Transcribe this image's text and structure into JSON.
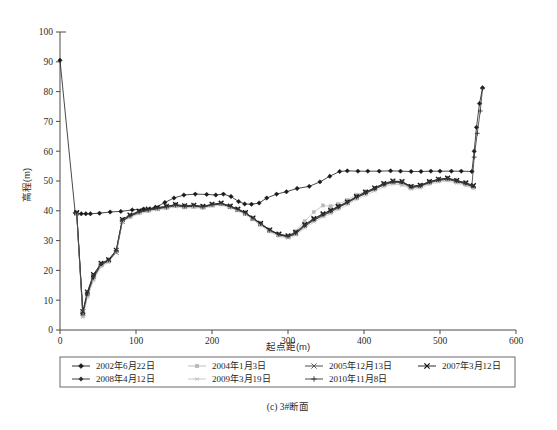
{
  "chart_data": {
    "type": "line",
    "title": "",
    "caption": "(c) 3#断面",
    "xlabel": "起点距(m)",
    "ylabel": "高程(m)",
    "xlim": [
      0,
      600
    ],
    "ylim": [
      0,
      100
    ],
    "xticks": [
      0,
      100,
      200,
      300,
      400,
      500,
      600
    ],
    "yticks": [
      0,
      10,
      20,
      30,
      40,
      50,
      60,
      70,
      80,
      90,
      100
    ],
    "grid": false,
    "legend_position": "bottom",
    "series": [
      {
        "name": "2002年6月22日",
        "marker": "diamond",
        "color": "#1a1a1a",
        "x": [
          0,
          20,
          28,
          34,
          40,
          52,
          66,
          80,
          95,
          110,
          125,
          138,
          150,
          163,
          178,
          193,
          205,
          215,
          225,
          235,
          243,
          252,
          262,
          272,
          285,
          298,
          312,
          328,
          342,
          355,
          368,
          378,
          392,
          405,
          420,
          435,
          448,
          462,
          475,
          488,
          500,
          515,
          528,
          542,
          545,
          548,
          552,
          556
        ],
        "y": [
          90.5,
          39.3,
          39.0,
          39.0,
          39.0,
          39.2,
          39.6,
          39.8,
          40.3,
          40.6,
          41.0,
          42.8,
          44.3,
          45.3,
          45.6,
          45.5,
          45.3,
          45.6,
          44.8,
          43.1,
          42.3,
          42.2,
          42.6,
          44.3,
          45.6,
          46.4,
          47.5,
          48.2,
          49.7,
          51.6,
          53.2,
          53.4,
          53.3,
          53.3,
          53.3,
          53.4,
          53.3,
          53.2,
          53.2,
          53.3,
          53.3,
          53.3,
          53.3,
          53.2,
          60.0,
          68.0,
          76.0,
          81.3
        ]
      },
      {
        "name": "2004年1月3日",
        "marker": "square-faint",
        "color": "#b8b8b8",
        "x": [
          22,
          30,
          36,
          44,
          54,
          64,
          74,
          82,
          92,
          104,
          116,
          128,
          140,
          152,
          164,
          176,
          188,
          200,
          212,
          224,
          234,
          244,
          254,
          264,
          276,
          288,
          300,
          310,
          322,
          334,
          346,
          356,
          366,
          378,
          390,
          402,
          414,
          426,
          438,
          450,
          462,
          474,
          486,
          498,
          510,
          522,
          534,
          544
        ],
        "y": [
          39.0,
          4.8,
          11.5,
          17.0,
          21.6,
          23.0,
          26.5,
          36.8,
          38.0,
          39.3,
          40.0,
          40.6,
          41.0,
          41.6,
          41.2,
          41.4,
          41.2,
          41.8,
          42.2,
          41.2,
          40.2,
          39.0,
          37.3,
          35.4,
          33.3,
          31.8,
          31.3,
          33.2,
          36.5,
          39.6,
          41.8,
          41.5,
          42.3,
          43.6,
          45.4,
          46.5,
          47.6,
          48.6,
          49.2,
          48.8,
          47.6,
          48.2,
          49.3,
          50.0,
          50.4,
          49.6,
          48.8,
          47.8
        ]
      },
      {
        "name": "2005年12月13日",
        "marker": "x",
        "color": "#3a3a3a",
        "x": [
          22,
          30,
          36,
          44,
          54,
          64,
          74,
          82,
          92,
          104,
          116,
          128,
          140,
          152,
          164,
          176,
          188,
          200,
          212,
          224,
          234,
          244,
          254,
          264,
          276,
          288,
          300,
          310,
          322,
          334,
          346,
          356,
          366,
          378,
          390,
          402,
          414,
          426,
          438,
          450,
          462,
          474,
          486,
          498,
          510,
          522,
          534,
          544
        ],
        "y": [
          39.2,
          5.6,
          12.2,
          18.0,
          22.0,
          23.3,
          26.0,
          36.4,
          38.3,
          39.6,
          40.3,
          40.8,
          41.3,
          41.9,
          41.4,
          41.6,
          41.3,
          42.0,
          42.4,
          41.4,
          40.4,
          39.2,
          37.5,
          35.6,
          33.5,
          32.0,
          31.4,
          32.4,
          35.0,
          37.0,
          38.6,
          39.8,
          41.2,
          42.8,
          44.5,
          46.0,
          47.4,
          48.9,
          49.8,
          49.6,
          48.0,
          48.4,
          49.6,
          50.4,
          50.8,
          50.0,
          49.2,
          48.2
        ]
      },
      {
        "name": "2007年3月12日",
        "marker": "x-bold",
        "color": "#111111",
        "x": [
          22,
          30,
          36,
          44,
          54,
          64,
          74,
          82,
          92,
          104,
          116,
          128,
          140,
          152,
          164,
          176,
          188,
          200,
          212,
          224,
          234,
          244,
          254,
          264,
          276,
          288,
          300,
          310,
          322,
          334,
          346,
          356,
          366,
          378,
          390,
          402,
          414,
          426,
          438,
          450,
          462,
          474,
          486,
          498,
          510,
          522,
          534,
          544
        ],
        "y": [
          39.4,
          6.2,
          12.8,
          18.6,
          22.4,
          23.6,
          26.8,
          37.1,
          38.6,
          39.9,
          40.6,
          41.1,
          41.5,
          42.1,
          41.7,
          41.9,
          41.5,
          42.2,
          42.6,
          41.6,
          40.6,
          39.4,
          37.6,
          35.8,
          33.6,
          32.2,
          31.6,
          32.8,
          35.4,
          37.4,
          39.0,
          40.2,
          41.5,
          43.0,
          44.8,
          46.3,
          47.7,
          49.2,
          50.0,
          49.8,
          48.2,
          48.6,
          49.8,
          50.6,
          51.0,
          50.2,
          49.4,
          48.5
        ]
      },
      {
        "name": "2008年4月12日",
        "marker": "diamond-small",
        "color": "#2a2a2a",
        "x": [
          22,
          30,
          36,
          44,
          54,
          64,
          74,
          82,
          92,
          104,
          116,
          128,
          140,
          152,
          164,
          176,
          188,
          200,
          212,
          224,
          234,
          244,
          254,
          264,
          276,
          288,
          300,
          310,
          322,
          334,
          346,
          356,
          366,
          378,
          390,
          402,
          414,
          426,
          438,
          450,
          462,
          474,
          486,
          498,
          510,
          522,
          534,
          544
        ],
        "y": [
          39.1,
          5.2,
          11.8,
          17.5,
          21.8,
          23.2,
          26.3,
          36.6,
          38.1,
          39.4,
          40.1,
          40.7,
          41.1,
          41.7,
          41.3,
          41.5,
          41.1,
          41.9,
          42.3,
          41.3,
          40.3,
          39.1,
          37.4,
          35.5,
          33.4,
          31.9,
          31.2,
          32.2,
          34.8,
          36.8,
          38.4,
          39.6,
          41.0,
          42.6,
          44.3,
          45.8,
          47.2,
          48.7,
          49.6,
          49.4,
          47.8,
          48.2,
          49.4,
          50.2,
          50.6,
          49.8,
          49.0,
          48.0
        ]
      },
      {
        "name": "2009年3月19日",
        "marker": "asterisk-faint",
        "color": "#c2c2c2",
        "x": [
          22,
          30,
          36,
          44,
          54,
          64,
          74,
          82,
          92,
          104,
          116,
          128,
          140,
          152,
          164,
          176,
          188,
          200,
          212,
          224,
          234,
          244,
          254,
          264,
          276,
          288,
          300,
          310,
          322,
          334,
          346,
          356,
          366,
          378,
          390,
          402,
          414,
          426,
          438,
          450,
          462,
          474,
          486,
          498,
          510,
          522,
          534,
          544
        ],
        "y": [
          38.9,
          4.2,
          11.0,
          16.5,
          21.2,
          22.7,
          26.0,
          36.2,
          37.7,
          39.0,
          39.7,
          40.3,
          40.7,
          41.3,
          40.9,
          41.1,
          40.8,
          41.5,
          41.9,
          40.9,
          39.9,
          38.7,
          37.0,
          35.0,
          32.9,
          31.4,
          30.8,
          31.8,
          34.2,
          36.2,
          37.9,
          39.0,
          40.4,
          42.0,
          43.8,
          45.2,
          46.6,
          48.0,
          48.9,
          48.7,
          47.2,
          47.6,
          48.8,
          49.6,
          50.0,
          49.2,
          48.4,
          47.4
        ]
      },
      {
        "name": "2010年11月8日",
        "marker": "plus",
        "color": "#333333",
        "x": [
          22,
          30,
          36,
          44,
          54,
          64,
          74,
          82,
          92,
          104,
          116,
          128,
          140,
          152,
          164,
          176,
          188,
          200,
          212,
          224,
          234,
          244,
          254,
          264,
          276,
          288,
          300,
          310,
          322,
          334,
          346,
          356,
          366,
          378,
          390,
          402,
          414,
          426,
          438,
          450,
          462,
          474,
          486,
          498,
          510,
          522,
          534,
          542,
          545,
          549,
          553,
          556
        ],
        "y": [
          39.3,
          5.8,
          12.5,
          18.3,
          22.2,
          23.5,
          26.6,
          36.9,
          38.4,
          39.7,
          40.4,
          41.0,
          41.4,
          42.0,
          41.6,
          41.8,
          41.4,
          42.1,
          42.5,
          41.5,
          40.5,
          39.3,
          37.5,
          35.7,
          33.5,
          32.1,
          31.5,
          32.6,
          35.2,
          37.2,
          38.8,
          40.0,
          41.3,
          42.9,
          44.6,
          46.1,
          47.5,
          49.0,
          49.9,
          49.7,
          48.1,
          48.5,
          49.7,
          50.5,
          50.9,
          50.1,
          49.3,
          48.4,
          58.0,
          66.0,
          73.5,
          81.0
        ]
      }
    ]
  },
  "legend": {
    "rows": [
      [
        {
          "label": "2002年6月22日",
          "marker": "diamond",
          "color": "#1a1a1a"
        },
        {
          "label": "2004年1月3日",
          "marker": "square-faint",
          "color": "#b8b8b8"
        },
        {
          "label": "2005年12月13日",
          "marker": "x",
          "color": "#3a3a3a"
        },
        {
          "label": "2007年3月12日",
          "marker": "x-bold",
          "color": "#111111"
        }
      ],
      [
        {
          "label": "2008年4月12日",
          "marker": "diamond-small",
          "color": "#2a2a2a"
        },
        {
          "label": "2009年3月19日",
          "marker": "asterisk-faint",
          "color": "#c2c2c2"
        },
        {
          "label": "2010年11月8日",
          "marker": "plus",
          "color": "#333333"
        }
      ]
    ]
  }
}
